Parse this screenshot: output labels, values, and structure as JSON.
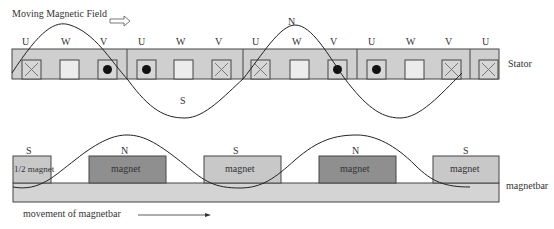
{
  "title": "Moving Magnetic Field",
  "stator": {
    "label": "Stator",
    "phase_labels": [
      "U",
      "W",
      "V",
      "U",
      "W",
      "V",
      "U",
      "W",
      "V",
      "U",
      "W",
      "V",
      "U"
    ],
    "slots": [
      "cross",
      "empty",
      "dot",
      "dot",
      "empty",
      "cross",
      "cross",
      "empty",
      "dot",
      "dot",
      "empty",
      "cross",
      "cross"
    ],
    "field_poles": {
      "north": "N",
      "south": "S"
    }
  },
  "magnetbar": {
    "label": "magnetbar",
    "magnets": [
      {
        "pole": "S",
        "label": "1/2 magnet",
        "type": "half"
      },
      {
        "pole": "N",
        "label": "magnet",
        "type": "north"
      },
      {
        "pole": "S",
        "label": "magnet",
        "type": "south"
      },
      {
        "pole": "N",
        "label": "magnet",
        "type": "north"
      },
      {
        "pole": "S",
        "label": "magnet",
        "type": "south"
      }
    ]
  },
  "movement_label": "movement of magnetbar",
  "colors": {
    "stator_fill": "#cfcfcf",
    "slot_fill": "#ececec",
    "north_magnet": "#8f8f8f",
    "south_magnet": "#c8c8c8",
    "bar_fill": "#d4d4d4",
    "line": "#333333"
  }
}
